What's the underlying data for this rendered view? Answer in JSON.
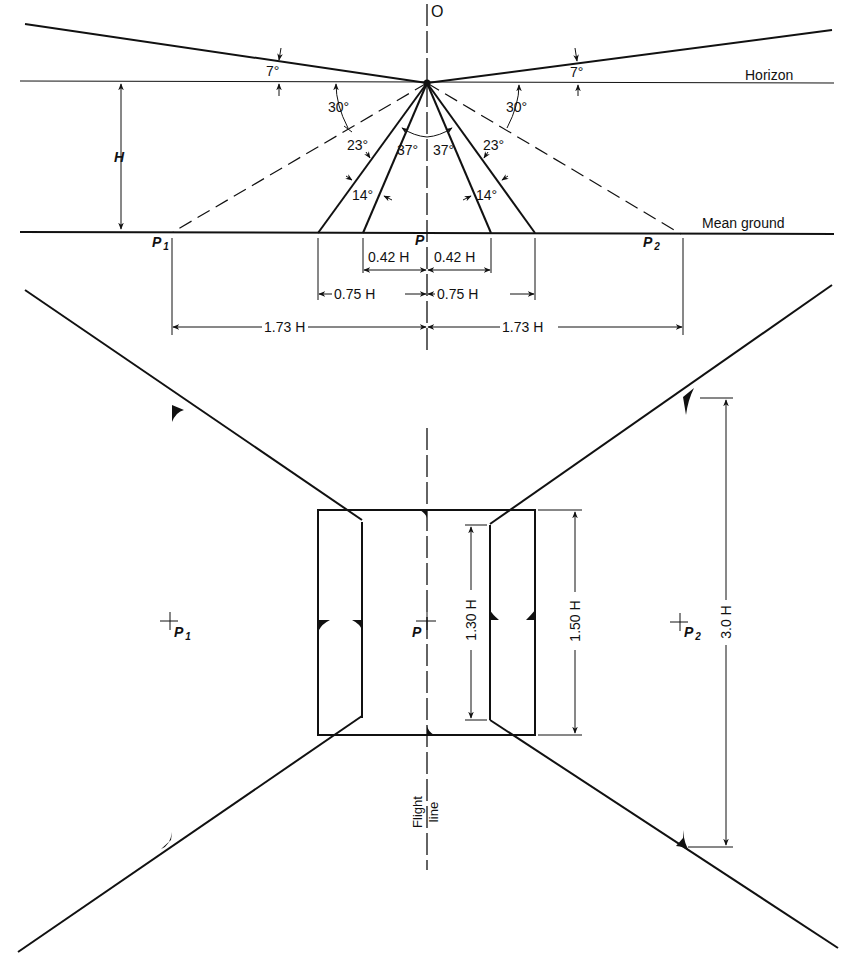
{
  "figure": {
    "top_view": {
      "point_o": "O",
      "horizon_label": "Horizon",
      "ground_label": "Mean ground",
      "height_label": "H",
      "angles": {
        "above_horizon_left": "7°",
        "above_horizon_right": "7°",
        "dashed_left": "30°",
        "dashed_right": "30°",
        "outer_left": "23°",
        "outer_right": "23°",
        "inner_left": "37°",
        "inner_right": "37°",
        "between_left": "14°",
        "between_right": "14°"
      },
      "points": {
        "p1": "P",
        "p1_sub": "1",
        "p": "P",
        "p2": "P",
        "p2_sub": "2"
      },
      "dimensions": {
        "inner_left": "0.42 H",
        "inner_right": "0.42 H",
        "mid_left": "0.75 H",
        "mid_right": "0.75 H",
        "outer_left": "1.73 H",
        "outer_right": "1.73 H"
      }
    },
    "plan_view": {
      "p1": "P",
      "p1_sub": "1",
      "p": "P",
      "p2": "P",
      "p2_sub": "2",
      "dim_inner": "1.30 H",
      "dim_rect": "1.50 H",
      "dim_outer": "3.0 H",
      "flight_line_1": "Flight",
      "flight_line_2": "line"
    }
  }
}
